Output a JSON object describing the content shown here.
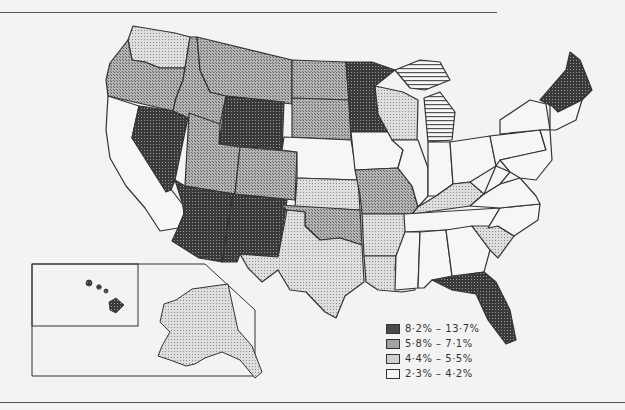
{
  "legend": {
    "items": [
      {
        "label": "8·2% – 13·7%",
        "fill": "#4a4a4a"
      },
      {
        "label": "5·8% – 7·1%",
        "fill": "#a2a2a2"
      },
      {
        "label": "4·4% – 5·5%",
        "fill": "#cfcfcf"
      },
      {
        "label": "2·3% – 4·2%",
        "fill": "#f6f6f6"
      }
    ]
  },
  "colors": {
    "dark": "#4a4a4a",
    "mid": "#a2a2a2",
    "light": "#cfcfcf",
    "white": "#f6f6f6",
    "line": "#333333",
    "page": "#f3f3f3"
  },
  "states": {
    "WA": "light",
    "OR": "mid",
    "CA": "white",
    "NV": "dark",
    "ID": "mid",
    "MT": "mid",
    "WY": "dark",
    "UT": "mid",
    "CO": "mid",
    "AZ": "dark",
    "NM": "dark",
    "ND": "mid",
    "SD": "mid",
    "NE": "white",
    "KS": "light",
    "OK": "mid",
    "TX": "light",
    "MN": "dark",
    "IA": "white",
    "MO": "mid",
    "AR": "light",
    "LA": "light",
    "WI": "light",
    "IL": "white",
    "MI": "striped",
    "IN": "white",
    "OH": "white",
    "KY": "light",
    "TN": "white",
    "MS": "white",
    "AL": "white",
    "GA": "white",
    "FL": "dark",
    "SC": "light",
    "NC": "white",
    "VA": "white",
    "WV": "white",
    "PA": "white",
    "NY": "white",
    "New England north": "dark",
    "New England south": "white",
    "AK": "light",
    "HI": "dark"
  }
}
